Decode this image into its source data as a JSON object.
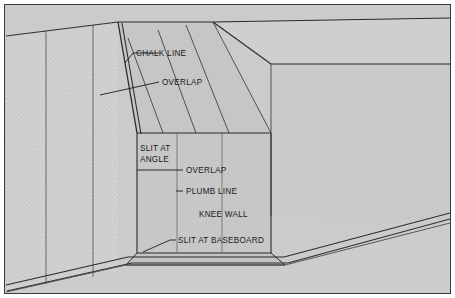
{
  "figure": {
    "type": "technical-illustration",
    "colors": {
      "paper": "#ffffff",
      "wall_fill": "#cdcdcd",
      "ceiling_fill": "#c9c9c9",
      "knee_wall_fill": "#c8c8c8",
      "floor_fill": "#cbcbcb",
      "textured_wall_fill": "#d4d4d4",
      "line": "#2a2a2a",
      "border": "#3a3a3a",
      "label_text": "#1b1b1b"
    },
    "border": {
      "outer_margin": 4,
      "stroke_width": 1
    }
  },
  "labels": [
    {
      "id": "chalk-line",
      "text": "CHALK LINE",
      "x": 136,
      "y": 56,
      "anchor": "start"
    },
    {
      "id": "overlap-ceiling",
      "text": "OVERLAP",
      "x": 162,
      "y": 85,
      "anchor": "start"
    },
    {
      "id": "slit-at-angle-1",
      "text": "SLIT AT",
      "x": 140,
      "y": 150,
      "anchor": "start"
    },
    {
      "id": "slit-at-angle-2",
      "text": "ANGLE",
      "x": 140,
      "y": 160,
      "anchor": "start"
    },
    {
      "id": "overlap-wall",
      "text": "OVERLAP",
      "x": 186,
      "y": 173,
      "anchor": "start"
    },
    {
      "id": "plumb-line",
      "text": "PLUMB LINE",
      "x": 186,
      "y": 194,
      "anchor": "start"
    },
    {
      "id": "knee-wall",
      "text": "KNEE WALL",
      "x": 199,
      "y": 217,
      "anchor": "start"
    },
    {
      "id": "slit-at-baseboard",
      "text": "SLIT AT BASEBOARD",
      "x": 177,
      "y": 243,
      "anchor": "start"
    }
  ],
  "leaders": [
    {
      "id": "leader-chalk-line",
      "points": "128,61 134,53"
    },
    {
      "id": "leader-overlap-ceiling",
      "points": "104,94 159,82"
    },
    {
      "id": "leader-slit-at-angle",
      "points": "137,166 139,166"
    },
    {
      "id": "leader-overlap-wall",
      "points": "141,170 183,170"
    },
    {
      "id": "leader-plumb-line",
      "points": "177,191 183,191"
    },
    {
      "id": "leader-slit-at-baseboard",
      "points": "168,240 174,240"
    }
  ],
  "geometry": {
    "textured_wall": {
      "name": "stippled-left-wall",
      "outline": "8,36 118,22 118,272 8,290",
      "panel_seams": [
        "46,30 46,283",
        "93,25 93,276"
      ],
      "stipple": {
        "dot_color": "#8a8a8a",
        "spacing": 4,
        "radius": 0.55
      }
    },
    "sloped_ceiling": {
      "name": "sloped-ceiling-plane",
      "outline": "118,22 213,22 271,133 137,133",
      "strips": [
        "100,36 140,133",
        "128,30 163,133",
        "160,26 196,133",
        "213,22 271,133"
      ]
    },
    "ceiling_right": {
      "name": "right-ceiling-plane",
      "outline": "213,22 447,22 447,64 271,64",
      "edges": [
        "213,22 271,64",
        "271,64 447,64"
      ]
    },
    "right_wall": {
      "name": "right-wall-plane",
      "outline": "271,64 447,64 447,216 271,216"
    },
    "knee_wall": {
      "name": "knee-wall-face",
      "outline": "137,133 271,133 271,253 137,253",
      "edges": {
        "left": "137,133 137,253",
        "right": "271,133 271,253",
        "top": "137,133 271,133",
        "bottom": "137,253 271,253"
      }
    },
    "knee_wall_top_cap": {
      "name": "knee-wall-top-cap",
      "outline": "137,253 271,253 283,264 127,264"
    },
    "floor": {
      "name": "floor-plane",
      "outline": "8,290 127,264 283,264 447,224 447,290"
    },
    "baseboard": {
      "name": "baseboard-lines",
      "lines": [
        "10,284 128,257 284,257 447,214",
        "12,290 131,263 287,263 447,220"
      ]
    },
    "corner_trim": {
      "name": "wall-corner-trim",
      "lines": [
        "118,22 137,133",
        "122,22 141,133"
      ]
    }
  }
}
